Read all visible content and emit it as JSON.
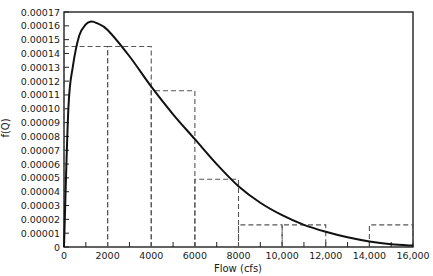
{
  "chart_data": {
    "type": "bar",
    "title": "",
    "xlabel": "Flow (cfs)",
    "ylabel": "f(Q)",
    "xlim": [
      0,
      16000
    ],
    "ylim": [
      0,
      0.00017
    ],
    "grid": false,
    "legend": null,
    "x_ticks": [
      0,
      2000,
      4000,
      6000,
      8000,
      10000,
      12000,
      14000,
      16000
    ],
    "x_tick_labels": [
      "0",
      "2000",
      "4000",
      "6000",
      "8000",
      "10,000",
      "12,000",
      "14,000",
      "16,000"
    ],
    "y_ticks": [
      0,
      1e-05,
      2e-05,
      3e-05,
      4e-05,
      5e-05,
      6e-05,
      7e-05,
      8e-05,
      9e-05,
      0.0001,
      0.00011,
      0.00012,
      0.00013,
      0.00014,
      0.00015,
      0.00016,
      0.00017
    ],
    "y_tick_labels": [
      "0",
      "0.00001",
      "0.00002",
      "0.00003",
      "0.00004",
      "0.00005",
      "0.00006",
      "0.00007",
      "0.00008",
      "0.00009",
      "0.00010",
      "0.00011",
      "0.00012",
      "0.00013",
      "0.00014",
      "0.00015",
      "0.00016",
      "0.00017"
    ],
    "series": [
      {
        "name": "Histogram (dashed)",
        "type": "bar",
        "style": "dashed",
        "bins": [
          [
            0,
            2000
          ],
          [
            2000,
            4000
          ],
          [
            4000,
            6000
          ],
          [
            6000,
            8000
          ],
          [
            8000,
            10000
          ],
          [
            10000,
            12000
          ],
          [
            12000,
            14000
          ],
          [
            14000,
            16000
          ]
        ],
        "values": [
          0.000145,
          0.000145,
          0.000113,
          4.9e-05,
          1.6e-05,
          1.6e-05,
          0.0,
          1.6e-05
        ]
      },
      {
        "name": "Fitted density f(Q)",
        "type": "line",
        "style": "solid",
        "x": [
          0,
          200,
          400,
          700,
          1000,
          1200,
          1500,
          2000,
          3000,
          4000,
          5000,
          6000,
          7000,
          8000,
          9000,
          10000,
          11000,
          12000,
          13000,
          14000,
          15000,
          16000
        ],
        "values": [
          0.0,
          0.0001,
          0.00013,
          0.000153,
          0.000161,
          0.000163,
          0.000162,
          0.000157,
          0.000138,
          0.000116,
          9.6e-05,
          7.8e-05,
          6e-05,
          4.4e-05,
          3.2e-05,
          2.3e-05,
          1.6e-05,
          1.1e-05,
          7e-06,
          4e-06,
          2e-06,
          1e-06
        ]
      }
    ]
  }
}
